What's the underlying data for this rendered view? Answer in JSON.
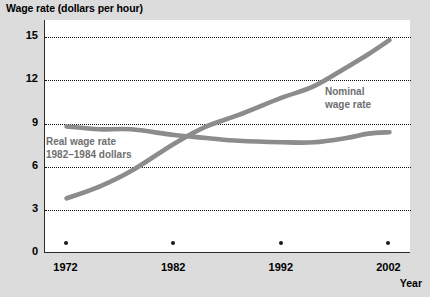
{
  "chart_data": {
    "type": "line",
    "title": "Wage rate (dollars per hour)",
    "xlabel": "Year",
    "ylabel": "Wage rate (dollars per hour)",
    "xlim": [
      1970,
      2004
    ],
    "ylim": [
      0,
      16.2
    ],
    "xticks": [
      1972,
      1982,
      1992,
      2002
    ],
    "xticklabels": [
      "1972",
      "1982",
      "1992",
      "2002"
    ],
    "yticks": [
      0,
      3,
      6,
      9,
      12,
      15
    ],
    "yticklabels": [
      "0",
      "3",
      "6",
      "9",
      "12",
      "15"
    ],
    "grid": "horizontal-dotted",
    "legend": "inline-annotations",
    "line_color": "#8c8c8c",
    "plot_background": "#ffffff",
    "page_background": "#dcdcdc",
    "series": [
      {
        "name": "Nominal wage rate",
        "label_line1": "Nominal",
        "label_line2": "wage rate",
        "x": [
          1972,
          1975,
          1978,
          1982,
          1985,
          1988,
          1992,
          1995,
          1998,
          2000,
          2002
        ],
        "values": [
          3.8,
          4.6,
          5.7,
          7.6,
          8.8,
          9.6,
          10.8,
          11.6,
          12.9,
          13.8,
          14.8
        ]
      },
      {
        "name": "Real wage rate, 1982-1984 dollars",
        "label_line1": "Real wage rate",
        "label_line2": "1982–1984 dollars",
        "x": [
          1972,
          1975,
          1978,
          1982,
          1985,
          1988,
          1992,
          1995,
          1998,
          2000,
          2002
        ],
        "values": [
          8.8,
          8.6,
          8.6,
          8.2,
          8.0,
          7.8,
          7.7,
          7.7,
          8.0,
          8.3,
          8.4
        ]
      }
    ]
  },
  "axes": {
    "year_axis_label": "Year"
  },
  "source": {
    "text": ""
  }
}
